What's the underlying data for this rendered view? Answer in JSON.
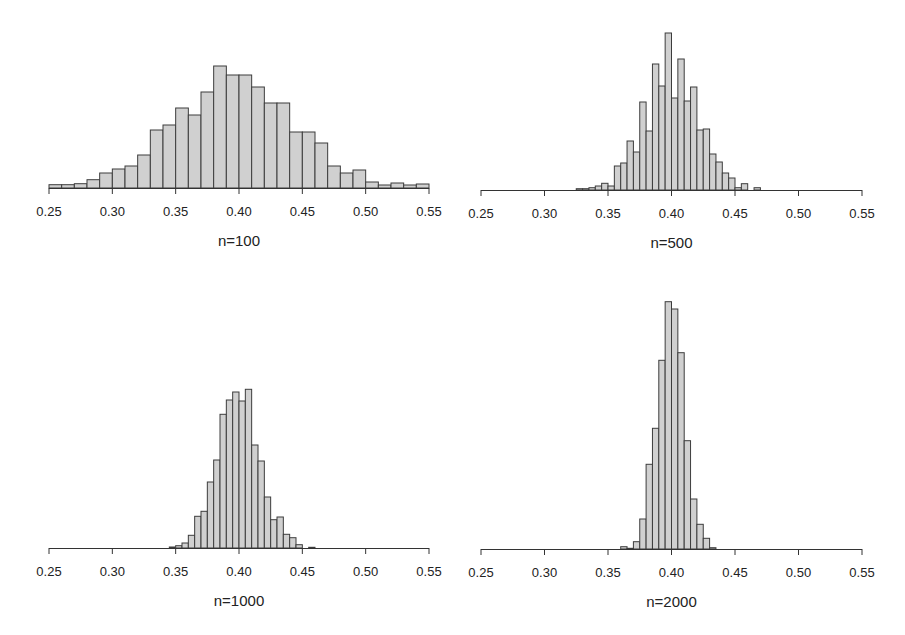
{
  "figure": {
    "bar_fill": "#d0d0d0",
    "bar_stroke": "#3c3c3c",
    "axis_color": "#333333",
    "background": "#ffffff"
  },
  "chart_data": [
    {
      "type": "bar",
      "subtype": "histogram",
      "title": "",
      "xlabel": "n=100",
      "ylabel": "",
      "xlim": [
        0.25,
        0.55
      ],
      "xticks": [
        "0.25",
        "0.30",
        "0.35",
        "0.40",
        "0.45",
        "0.50",
        "0.55"
      ],
      "grid": false,
      "y_axis_shown": false,
      "bin_start": 0.25,
      "bin_width": 0.01,
      "values": [
        3.3,
        3.3,
        4.3,
        8.3,
        15,
        19,
        22,
        33,
        58,
        63,
        80,
        73,
        96,
        122,
        113,
        113,
        101,
        85,
        85,
        56,
        56,
        45,
        22,
        15,
        18,
        6,
        3,
        5,
        3,
        4
      ],
      "value_units": "relative bar height (px)",
      "layout": {
        "x0": 49,
        "x1": 429,
        "baseline": 188,
        "label_y": 216,
        "caption_y": 246
      }
    },
    {
      "type": "bar",
      "subtype": "histogram",
      "title": "",
      "xlabel": "n=500",
      "ylabel": "",
      "xlim": [
        0.25,
        0.55
      ],
      "xticks": [
        "0.25",
        "0.30",
        "0.35",
        "0.40",
        "0.45",
        "0.50",
        "0.55"
      ],
      "grid": false,
      "y_axis_shown": false,
      "bin_start": 0.325,
      "bin_width": 0.005,
      "values": [
        1.3,
        1.3,
        2.3,
        4,
        6.7,
        4,
        24,
        27,
        49,
        38,
        88,
        59,
        126,
        104,
        157,
        92,
        131,
        89,
        103,
        60,
        61,
        36,
        28,
        17,
        12,
        2.3,
        6.3,
        0,
        2.3
      ],
      "value_units": "relative bar height (px)",
      "layout": {
        "x0": 481,
        "x1": 862,
        "baseline": 190,
        "label_y": 218,
        "caption_y": 248
      }
    },
    {
      "type": "bar",
      "subtype": "histogram",
      "title": "",
      "xlabel": "n=1000",
      "ylabel": "",
      "xlim": [
        0.25,
        0.55
      ],
      "xticks": [
        "0.25",
        "0.30",
        "0.35",
        "0.40",
        "0.45",
        "0.50",
        "0.55"
      ],
      "grid": false,
      "y_axis_shown": false,
      "bin_start": 0.345,
      "bin_width": 0.005,
      "values": [
        1,
        2.3,
        5,
        12.7,
        31.7,
        36.7,
        66,
        88,
        133.7,
        148,
        156,
        147,
        158.7,
        103,
        87,
        51,
        28.3,
        31,
        13.7,
        10.3,
        3.3,
        0,
        0.7
      ],
      "value_units": "relative bar height (px)",
      "layout": {
        "x0": 49,
        "x1": 429,
        "baseline": 548,
        "label_y": 576,
        "caption_y": 606
      }
    },
    {
      "type": "bar",
      "subtype": "histogram",
      "title": "",
      "xlabel": "n=2000",
      "ylabel": "",
      "xlim": [
        0.25,
        0.55
      ],
      "xticks": [
        "0.25",
        "0.30",
        "0.35",
        "0.40",
        "0.45",
        "0.50",
        "0.55"
      ],
      "grid": false,
      "y_axis_shown": false,
      "bin_start": 0.36,
      "bin_width": 0.005,
      "values": [
        2.3,
        0.7,
        7.3,
        30,
        84.7,
        120.7,
        188.7,
        247.3,
        240,
        196.3,
        108.3,
        50,
        24.7,
        10.7,
        1.3
      ],
      "value_units": "relative bar height (px)",
      "layout": {
        "x0": 481,
        "x1": 862,
        "baseline": 549,
        "label_y": 577,
        "caption_y": 607
      }
    }
  ]
}
